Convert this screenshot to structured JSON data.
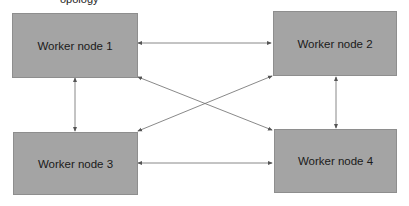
{
  "diagram": {
    "top_text_partial": "opology",
    "nodes": [
      {
        "id": "n1",
        "label": "Worker node 1"
      },
      {
        "id": "n2",
        "label": "Worker node 2"
      },
      {
        "id": "n3",
        "label": "Worker node 3"
      },
      {
        "id": "n4",
        "label": "Worker node 4"
      }
    ],
    "edges": [
      {
        "from": "n1",
        "to": "n2",
        "bidirectional": true
      },
      {
        "from": "n1",
        "to": "n3",
        "bidirectional": true
      },
      {
        "from": "n1",
        "to": "n4",
        "bidirectional": true
      },
      {
        "from": "n2",
        "to": "n3",
        "bidirectional": true
      },
      {
        "from": "n2",
        "to": "n4",
        "bidirectional": true
      },
      {
        "from": "n3",
        "to": "n4",
        "bidirectional": true
      }
    ],
    "colors": {
      "node_fill": "#a4a4a4",
      "edge": "#666666"
    }
  }
}
